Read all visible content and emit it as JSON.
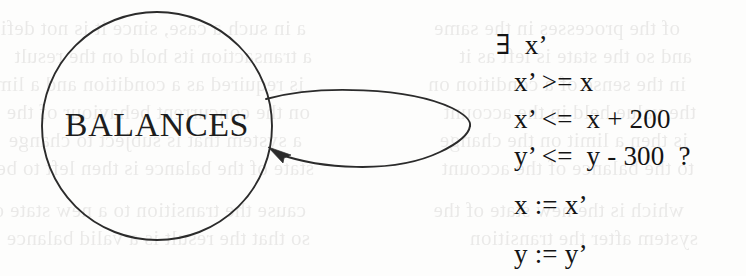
{
  "figure": {
    "kind": "state-transition-diagram",
    "background_color": "#fdfdfc",
    "ink_color": "#1d1d1d",
    "width": 746,
    "height": 276
  },
  "node": {
    "label": "BALANCES",
    "shape": "circle",
    "center_x": 157,
    "center_y": 126,
    "radius": 115,
    "stroke_color": "#2b2b2b"
  },
  "self_loop": {
    "shape": "lens",
    "arrowhead": "arrow-into-node",
    "stroke_color": "#2b2b2b",
    "attach_top_x": 270,
    "attach_top_y": 103,
    "attach_bottom_x": 272,
    "attach_bottom_y": 150,
    "apex_x": 470,
    "apex_y": 126
  },
  "annotation": {
    "lines": [
      {
        "text": "∃  x’",
        "role": "quantifier"
      },
      {
        "text": "x’ >= x",
        "role": "guard"
      },
      {
        "text": "x’ <=  x + 200",
        "role": "guard"
      },
      {
        "text": "y’ <=  y - 300  ?",
        "role": "guard"
      },
      {
        "text": "x := x’",
        "role": "assignment"
      },
      {
        "text": "y := y’",
        "role": "assignment"
      }
    ]
  },
  "bleed_through": {
    "description": "faint mirrored text showing through from the reverse side of the scanned page",
    "color": "#5d5a57",
    "lines": [
      {
        "text": "a in such a case, since it is not defined",
        "x": 6,
        "y": 16
      },
      {
        "text": "a transaction its hold on the result",
        "x": 12,
        "y": 44
      },
      {
        "text": "is required as a condition and a limit",
        "x": 4,
        "y": 72
      },
      {
        "text": "on the concurrent behaviour of the",
        "x": 10,
        "y": 100
      },
      {
        "text": "a system that is subject to change",
        "x": 2,
        "y": 128
      },
      {
        "text": "state of the balance is then left to be",
        "x": 14,
        "y": 156
      },
      {
        "text": "cause the transition to a new state of",
        "x": 6,
        "y": 198
      },
      {
        "text": "so that the result is a valid balance",
        "x": 10,
        "y": 226
      },
      {
        "text": "of the processes in the same",
        "x": 380,
        "y": 16
      },
      {
        "text": "and so the state is left as it",
        "x": 392,
        "y": 44
      },
      {
        "text": "in the sense of a condition on",
        "x": 386,
        "y": 72
      },
      {
        "text": "the value held in the account",
        "x": 396,
        "y": 100
      },
      {
        "text": "is then a limit on the change",
        "x": 388,
        "y": 128
      },
      {
        "text": "to the balance of the account",
        "x": 394,
        "y": 156
      },
      {
        "text": "which is the new state of the",
        "x": 384,
        "y": 198
      },
      {
        "text": "system after the transition",
        "x": 398,
        "y": 226
      }
    ]
  }
}
